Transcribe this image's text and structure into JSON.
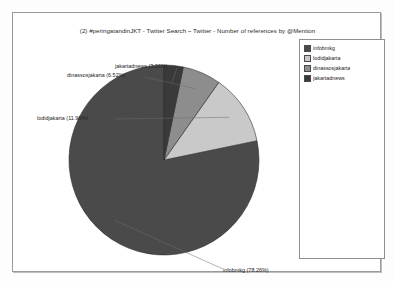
{
  "chart_data": {
    "type": "pie",
    "title": "(2) #peringatandinJKT - Twitter Search ~ Twitter - Number of references by @Mention",
    "categories": [
      "infobmkg",
      "lodidjakarta",
      "dinassosjakarta",
      "jakartadnews"
    ],
    "values": [
      78.26,
      11.96,
      6.52,
      3.26
    ],
    "value_unit": "%",
    "slice_labels": [
      "infobmkg (78.26%)",
      "lodidjakarta (11.96%)",
      "dinassosjakarta (6.52%)",
      "jakartadnews (3.26%)"
    ],
    "colors": [
      "#4a4a4a",
      "#c9c9c9",
      "#8d8d8d",
      "#3a3a3a"
    ],
    "legend_position": "right",
    "start_angle_deg": 90,
    "direction": "counterclockwise",
    "grid": false,
    "xlabel": "",
    "ylabel": ""
  },
  "legend": {
    "entries": [
      {
        "label": "infobmkg",
        "color": "#4a4a4a"
      },
      {
        "label": "lodidjakarta",
        "color": "#c9c9c9"
      },
      {
        "label": "dinassosjakarta",
        "color": "#8d8d8d"
      },
      {
        "label": "jakartadnews",
        "color": "#3a3a3a"
      }
    ]
  },
  "geometry": {
    "center_x": 137,
    "center_y": 123,
    "radius": 95
  }
}
